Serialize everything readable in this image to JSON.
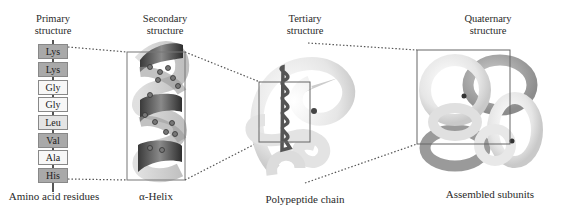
{
  "figure": {
    "panels": [
      {
        "id": "primary",
        "title_line1": "Primary",
        "title_line2": "structure",
        "caption": "Amino acid residues"
      },
      {
        "id": "secondary",
        "title_line1": "Secondary",
        "title_line2": "structure",
        "caption": "α-Helix"
      },
      {
        "id": "tertiary",
        "title_line1": "Tertiary",
        "title_line2": "structure",
        "caption": "Polypeptide chain"
      },
      {
        "id": "quaternary",
        "title_line1": "Quaternary",
        "title_line2": "structure",
        "caption": "Assembled subunits"
      }
    ],
    "residues": [
      {
        "name": "Lys",
        "shade": "dark"
      },
      {
        "name": "Lys",
        "shade": "dark"
      },
      {
        "name": "Gly",
        "shade": "white"
      },
      {
        "name": "Gly",
        "shade": "white"
      },
      {
        "name": "Leu",
        "shade": "light"
      },
      {
        "name": "Val",
        "shade": "dark"
      },
      {
        "name": "Ala",
        "shade": "white"
      },
      {
        "name": "His",
        "shade": "dark"
      }
    ],
    "colors": {
      "dark": "#a9a9a9",
      "light": "#e4e4e4",
      "white": "#f7f7f7",
      "connector": "#555555",
      "box": "#666666"
    }
  }
}
